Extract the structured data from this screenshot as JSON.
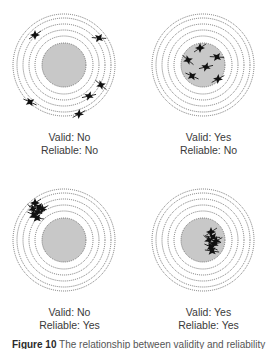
{
  "figure": {
    "caption_label": "Figure 10",
    "caption_text": " The relationship between validity and reliability",
    "colors": {
      "bullseye_fill": "#c8c8c8",
      "ring_stroke": "#555555",
      "hit_mark": "#111111",
      "label_text": "#3a3a3a"
    },
    "panels": [
      {
        "id": "not-valid-not-reliable",
        "valid_text": "Valid: No",
        "reliable_text": "Reliable: No",
        "hits": [
          [
            -29,
            -30
          ],
          [
            35,
            -27
          ],
          [
            37,
            20
          ],
          [
            25,
            31
          ],
          [
            -34,
            37
          ],
          [
            15,
            49
          ]
        ]
      },
      {
        "id": "valid-not-reliable",
        "valid_text": "Valid: Yes",
        "reliable_text": "Reliable: No",
        "hits": [
          [
            -3,
            -17
          ],
          [
            14,
            -8
          ],
          [
            -15,
            -5
          ],
          [
            3,
            2
          ],
          [
            -11,
            11
          ],
          [
            15,
            14
          ]
        ]
      },
      {
        "id": "not-valid-reliable",
        "valid_text": "Valid: No",
        "reliable_text": "Reliable: Yes",
        "hits": [
          [
            -29,
            -37
          ],
          [
            -25,
            -33
          ],
          [
            -31,
            -31
          ],
          [
            -26,
            -28
          ],
          [
            -30,
            -25
          ],
          [
            -22,
            -31
          ],
          [
            -27,
            -22
          ]
        ]
      },
      {
        "id": "valid-reliable",
        "valid_text": "Valid: Yes",
        "reliable_text": "Reliable: Yes",
        "hits": [
          [
            8,
            -8
          ],
          [
            10,
            -3
          ],
          [
            6,
            0
          ],
          [
            11,
            4
          ],
          [
            8,
            7
          ],
          [
            13,
            1
          ],
          [
            9,
            11
          ]
        ]
      }
    ]
  }
}
